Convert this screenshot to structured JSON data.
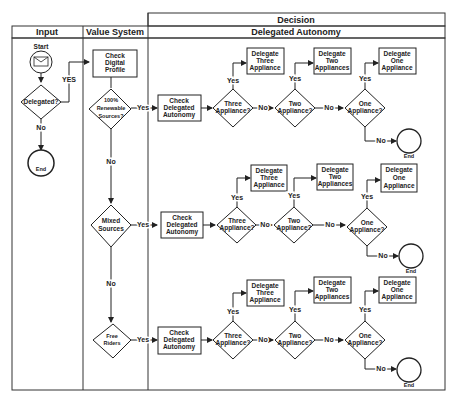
{
  "diagram": {
    "lanes": {
      "decision_header": "Decision",
      "input": "Input",
      "value_system": "Value System",
      "delegated_autonomy": "Delegated Autonomy"
    },
    "input_lane": {
      "start_label": "Start",
      "start_icon": "envelope-icon",
      "delegated_decision": "Delegated?",
      "yes_label": "YES",
      "no_label": "No",
      "end_label": "End"
    },
    "value_system_lane": {
      "check_profile": [
        "Check",
        "Digital",
        "Profile"
      ],
      "renewable": [
        "100%",
        "Renewable",
        "Sources?"
      ],
      "mixed": [
        "Mixed",
        "Sources"
      ],
      "free_riders": [
        "Free",
        "Riders"
      ],
      "no_label_1": "No",
      "no_label_2": "No"
    },
    "rows": [
      {
        "yes_in": "Yes",
        "check": [
          "Check",
          "Delegated",
          "Autonomy"
        ],
        "three_q": [
          "Three",
          "Appliance?"
        ],
        "three_box": [
          "Delegate",
          "Three",
          "Appliance"
        ],
        "two_q": [
          "Two",
          "Appliance?"
        ],
        "two_box": [
          "Delegate",
          "Two",
          "Appliances"
        ],
        "one_q": [
          "One",
          "Appliance?"
        ],
        "one_box": [
          "Delegate",
          "One",
          "Appliance"
        ],
        "yes": "Yes",
        "no": "No",
        "end": "End"
      },
      {
        "yes_in": "Yes",
        "check": [
          "Check",
          "Delegated",
          "Autonomy"
        ],
        "three_q": [
          "Three",
          "Appliance?"
        ],
        "three_box": [
          "Delegate",
          "Three",
          "Appliance"
        ],
        "two_q": [
          "Two",
          "Appliance?"
        ],
        "two_box": [
          "Delegate",
          "Two",
          "Appliances"
        ],
        "one_q": [
          "One",
          "Appliance?"
        ],
        "one_box": [
          "Delegate",
          "One",
          "Appliance"
        ],
        "yes": "Yes",
        "no": "No",
        "end": "End"
      },
      {
        "yes_in": "Yes",
        "check": [
          "Check",
          "Delegated",
          "Autonomy"
        ],
        "three_q": [
          "Three",
          "Appliance?"
        ],
        "three_box": [
          "Delegate",
          "Three",
          "Appliance"
        ],
        "two_q": [
          "Two",
          "Appliance?"
        ],
        "two_box": [
          "Delegate",
          "Two",
          "Appliances"
        ],
        "one_q": [
          "One",
          "Appliance?"
        ],
        "one_box": [
          "Delegate",
          "One",
          "Appliance"
        ],
        "yes": "Yes",
        "no": "No",
        "end": "End"
      }
    ]
  }
}
